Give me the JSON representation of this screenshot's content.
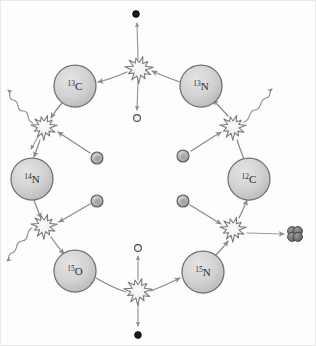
{
  "diagram": {
    "type": "nuclear-reaction-cycle",
    "background_color": "#fdfdfc",
    "frame_border_color": "#e8e8e6",
    "arrow_color": "#8a8a8a",
    "nucleus_fill": "#cfcfcf",
    "nucleus_stroke": "#6e6e6e",
    "starburst_fill": "#ececec",
    "starburst_stroke": "#787878",
    "proton_fill": "#b0b0b0",
    "proton_stroke": "#5a5a5a",
    "neutrino_fill": "#1a1a1a",
    "positron_fill": "#f2f2f2",
    "alpha_fill": "#707070",
    "gamma_stroke": "#8f8f8f"
  },
  "nuclei": [
    {
      "id": "c13",
      "mass": "13",
      "element": "C",
      "label": "13C",
      "cx": 74,
      "cy": 85,
      "r": 21
    },
    {
      "id": "n13",
      "mass": "13",
      "element": "N",
      "label": "13N",
      "cx": 200,
      "cy": 85,
      "r": 21
    },
    {
      "id": "n14",
      "mass": "14",
      "element": "N",
      "label": "14N",
      "cx": 31,
      "cy": 178,
      "r": 21
    },
    {
      "id": "c12",
      "mass": "12",
      "element": "C",
      "label": "12C",
      "cx": 248,
      "cy": 178,
      "r": 21
    },
    {
      "id": "o15",
      "mass": "15",
      "element": "O",
      "label": "15O",
      "cx": 74,
      "cy": 270,
      "r": 21
    },
    {
      "id": "n15",
      "mass": "15",
      "element": "N",
      "label": "15N",
      "cx": 202,
      "cy": 271,
      "r": 21
    }
  ],
  "reaction_sites": [
    {
      "id": "beta-decay-top",
      "name": "n13-beta-plus-decay",
      "cx": 138,
      "cy": 68,
      "r": 13
    },
    {
      "id": "capture-upper-left",
      "name": "c13-proton-capture",
      "cx": 43,
      "cy": 126,
      "r": 12
    },
    {
      "id": "capture-upper-right",
      "name": "c12-proton-capture",
      "cx": 232,
      "cy": 126,
      "r": 12
    },
    {
      "id": "capture-lower-left",
      "name": "n14-proton-capture",
      "cx": 43,
      "cy": 225,
      "r": 12
    },
    {
      "id": "capture-lower-right",
      "name": "n15-proton-capture",
      "cx": 232,
      "cy": 228,
      "r": 12
    },
    {
      "id": "beta-decay-bottom",
      "name": "o15-beta-plus-decay",
      "cx": 137,
      "cy": 290,
      "r": 13
    }
  ],
  "protons": [
    {
      "id": "proton-upper-left",
      "cx": 96,
      "cy": 157,
      "r": 6
    },
    {
      "id": "proton-upper-right",
      "cx": 182,
      "cy": 155,
      "r": 6
    },
    {
      "id": "proton-lower-left",
      "cx": 96,
      "cy": 200,
      "r": 6
    },
    {
      "id": "proton-lower-right",
      "cx": 182,
      "cy": 200,
      "r": 6
    }
  ],
  "neutrinos": [
    {
      "id": "neutrino-top",
      "cx": 135,
      "cy": 13,
      "r": 3.4
    },
    {
      "id": "neutrino-bottom",
      "cx": 137,
      "cy": 334,
      "r": 3.4
    }
  ],
  "positrons": [
    {
      "id": "positron-top",
      "cx": 136,
      "cy": 117,
      "r": 3.4
    },
    {
      "id": "positron-bottom",
      "cx": 137,
      "cy": 247,
      "r": 3.4
    }
  ],
  "alpha_particle": {
    "id": "alpha-particle",
    "cx": 294,
    "cy": 233,
    "r": 4.6
  },
  "gamma_rays": [
    {
      "id": "gamma-upper-left",
      "direction": "up-left"
    },
    {
      "id": "gamma-upper-right",
      "direction": "up-right"
    },
    {
      "id": "gamma-lower-left",
      "direction": "left"
    }
  ],
  "chart_data": {
    "type": "diagram",
    "nodes": [
      "12C",
      "13N",
      "13C",
      "14N",
      "15O",
      "15N"
    ],
    "emitted_particles": [
      "neutrino",
      "positron",
      "gamma",
      "alpha"
    ],
    "absorbed_particles": [
      "proton",
      "proton",
      "proton",
      "proton"
    ],
    "steps": [
      {
        "from": "12C",
        "reaction": "proton capture",
        "to": "13N",
        "emits": "gamma"
      },
      {
        "from": "13N",
        "reaction": "beta-plus decay",
        "to": "13C",
        "emits": "positron + neutrino"
      },
      {
        "from": "13C",
        "reaction": "proton capture",
        "to": "14N",
        "emits": "gamma"
      },
      {
        "from": "14N",
        "reaction": "proton capture",
        "to": "15O",
        "emits": "gamma"
      },
      {
        "from": "15O",
        "reaction": "beta-plus decay",
        "to": "15N",
        "emits": "positron + neutrino"
      },
      {
        "from": "15N",
        "reaction": "proton capture",
        "to": "12C",
        "emits": "alpha"
      }
    ]
  }
}
